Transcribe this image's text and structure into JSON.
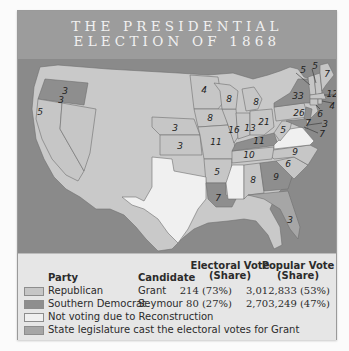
{
  "title": {
    "line1": "THE PRESIDENTIAL",
    "line2": "ELECTION OF 1868"
  },
  "colors": {
    "republican": "#c6c6c6",
    "southern_democrat": "#8e8e8e",
    "not_voting": "#f0f0f0",
    "legislature": "#a6a6a6",
    "non_voting_territory": "#c9c9c9",
    "water": "#8a8a8a",
    "title_bar": "#9c9c9c"
  },
  "map": {
    "non_voting_legend": "Non-voting territory",
    "states": [
      {
        "name": "Oregon",
        "votes": "3",
        "party": "southern_democrat"
      },
      {
        "name": "California",
        "votes": "5",
        "party": "republican"
      },
      {
        "name": "Nevada",
        "votes": "3",
        "party": "republican"
      },
      {
        "name": "Minnesota",
        "votes": "4",
        "party": "republican"
      },
      {
        "name": "Iowa",
        "votes": "8",
        "party": "republican"
      },
      {
        "name": "Nebraska",
        "votes": "3",
        "party": "republican"
      },
      {
        "name": "Kansas",
        "votes": "3",
        "party": "republican"
      },
      {
        "name": "Missouri",
        "votes": "11",
        "party": "republican"
      },
      {
        "name": "Arkansas",
        "votes": "5",
        "party": "republican"
      },
      {
        "name": "Louisiana",
        "votes": "7",
        "party": "southern_democrat"
      },
      {
        "name": "Wisconsin",
        "votes": "8",
        "party": "republican"
      },
      {
        "name": "Michigan",
        "votes": "8",
        "party": "republican"
      },
      {
        "name": "Illinois",
        "votes": "16",
        "party": "republican"
      },
      {
        "name": "Indiana",
        "votes": "13",
        "party": "republican"
      },
      {
        "name": "Ohio",
        "votes": "21",
        "party": "republican"
      },
      {
        "name": "Kentucky",
        "votes": "11",
        "party": "southern_democrat"
      },
      {
        "name": "Tennessee",
        "votes": "10",
        "party": "republican"
      },
      {
        "name": "West Virginia",
        "votes": "5",
        "party": "republican"
      },
      {
        "name": "Pennsylvania",
        "votes": "26",
        "party": "republican"
      },
      {
        "name": "New York",
        "votes": "33",
        "party": "southern_democrat"
      },
      {
        "name": "Vermont",
        "votes": "5",
        "party": "republican"
      },
      {
        "name": "New Hampshire",
        "votes": "5",
        "party": "republican"
      },
      {
        "name": "Maine",
        "votes": "7",
        "party": "republican"
      },
      {
        "name": "Massachusetts",
        "votes": "12",
        "party": "republican"
      },
      {
        "name": "Rhode Island",
        "votes": "4",
        "party": "republican"
      },
      {
        "name": "Connecticut",
        "votes": "6",
        "party": "republican"
      },
      {
        "name": "New Jersey",
        "votes": "7",
        "party": "southern_democrat"
      },
      {
        "name": "Delaware",
        "votes": "3",
        "party": "southern_democrat"
      },
      {
        "name": "Maryland",
        "votes": "7",
        "party": "southern_democrat"
      },
      {
        "name": "North Carolina",
        "votes": "9",
        "party": "republican"
      },
      {
        "name": "South Carolina",
        "votes": "6",
        "party": "republican"
      },
      {
        "name": "Georgia",
        "votes": "9",
        "party": "southern_democrat"
      },
      {
        "name": "Alabama",
        "votes": "8",
        "party": "republican"
      },
      {
        "name": "Florida",
        "votes": "3",
        "party": "legislature"
      },
      {
        "name": "Virginia",
        "votes": "",
        "party": "not_voting"
      },
      {
        "name": "Mississippi",
        "votes": "",
        "party": "not_voting"
      },
      {
        "name": "Texas",
        "votes": "",
        "party": "not_voting"
      }
    ]
  },
  "legend": {
    "headers": {
      "party": "Party",
      "candidate": "Candidate",
      "electoral_line1": "Electoral Vote",
      "electoral_line2": "(Share)",
      "popular_line1": "Popular Vote",
      "popular_line2": "(Share)"
    },
    "rows": [
      {
        "party": "Republican",
        "candidate": "Grant",
        "electoral": "214 (73%)",
        "popular": "3,012,833 (53%)"
      },
      {
        "party": "Southern Democrat",
        "candidate": "Seymour",
        "electoral": "80 (27%)",
        "popular": "2,703,249 (47%)"
      },
      {
        "party": "Not voting due to Reconstruction",
        "candidate": "",
        "electoral": "",
        "popular": ""
      },
      {
        "party": "State legislature cast the electoral votes for Grant",
        "candidate": "",
        "electoral": "",
        "popular": ""
      }
    ]
  }
}
